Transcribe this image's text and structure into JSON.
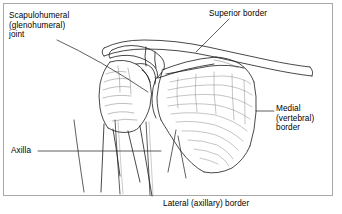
{
  "figure": {
    "name": "shoulder-scapula-anatomy",
    "view": "Posterior view of right shoulder girdle",
    "frame_border_color": "#a8a8a8",
    "background_color": "#ffffff",
    "line_color": "#1a1a1a",
    "text_color": "#000000"
  },
  "labels": {
    "scapulohumeral": "Scapulohumeral\n(glenohumeral)\njoint",
    "superior_border": "Superior border",
    "medial_border": "Medial\n(vertebral)\nborder",
    "axilla": "Axilla",
    "lateral_border": "Lateral (axillary) border"
  },
  "structures": [
    {
      "name": "clavicle",
      "label_ref": "superior_border"
    },
    {
      "name": "acromion",
      "label_ref": "superior_border"
    },
    {
      "name": "humerus-head",
      "label_ref": "scapulohumeral"
    },
    {
      "name": "humerus-shaft",
      "label_ref": "axilla"
    },
    {
      "name": "glenoid-cavity",
      "label_ref": "scapulohumeral"
    },
    {
      "name": "scapula-blade",
      "label_ref": "medial_border"
    },
    {
      "name": "scapula-inferior-angle",
      "label_ref": "lateral_border"
    },
    {
      "name": "ribs",
      "label_ref": "axilla"
    }
  ]
}
